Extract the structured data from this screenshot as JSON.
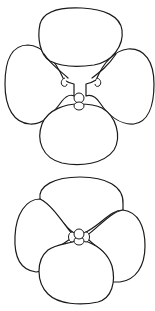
{
  "figure": {
    "title": "",
    "background": "#ffffff",
    "stroke_color": "#1a1a1a",
    "flowers": [
      {
        "id": "flower-top",
        "label": "",
        "petals": [
          "upper",
          "left-lateral",
          "right-lateral",
          "lower"
        ],
        "arrangement": "spread, petals separated",
        "center": "style/stigma with two small lateral beards"
      },
      {
        "id": "flower-bottom",
        "label": "",
        "petals": [
          "upper",
          "left-lateral",
          "right-lateral",
          "lower"
        ],
        "arrangement": "overlapping, compact",
        "center": "style/stigma with small lobes"
      }
    ]
  }
}
